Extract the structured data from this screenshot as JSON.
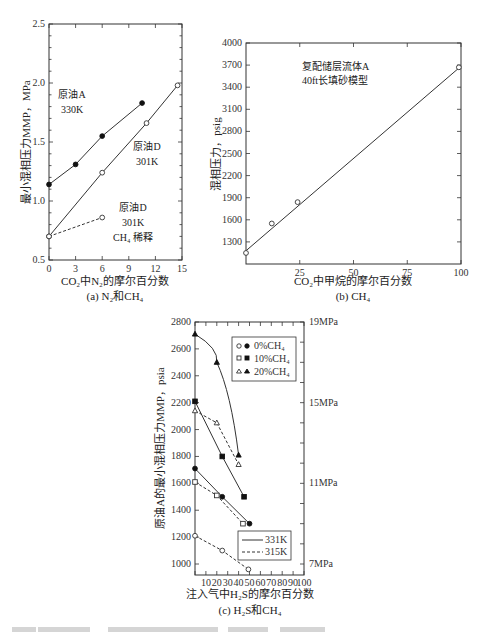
{
  "chart_data": [
    {
      "id": "a",
      "type": "line",
      "caption": "(a) N2和CH4",
      "xlabel": "CO2中N2的摩尔百分数",
      "ylabel": "最小混相压力MMP，MPa",
      "xlim": [
        0,
        15
      ],
      "ylim": [
        0.5,
        2.5
      ],
      "xticks": [
        0,
        3,
        6,
        9,
        12,
        15
      ],
      "yticks": [
        0.5,
        1.0,
        1.5,
        2.0,
        2.5
      ],
      "ytick_labels": [
        "0.5",
        "1.0",
        "1.5",
        "2.0",
        "2.5"
      ],
      "series": [
        {
          "name": "原油A 330K",
          "marker": "filled-circle",
          "line": "solid",
          "x": [
            0,
            3,
            6,
            10.5
          ],
          "y": [
            1.14,
            1.31,
            1.55,
            1.83
          ]
        },
        {
          "name": "原油D 301K",
          "marker": "open-circle",
          "line": "solid",
          "x": [
            0,
            6,
            11,
            14.5
          ],
          "y": [
            0.7,
            1.24,
            1.66,
            1.98
          ]
        },
        {
          "name": "原油D 301K CH4稀释",
          "marker": "open-circle",
          "line": "dashed",
          "x": [
            0,
            6
          ],
          "y": [
            0.7,
            0.86
          ]
        }
      ],
      "annotations": [
        {
          "text": "原油A",
          "x": 2.0,
          "y": 1.6
        },
        {
          "text": "330K",
          "x": 2.0,
          "y": 1.47
        },
        {
          "text": "原油D",
          "x": 10.8,
          "y": 1.48
        },
        {
          "text": "301K",
          "x": 10.8,
          "y": 1.35
        },
        {
          "text": "原油D",
          "x": 9.5,
          "y": 0.99
        },
        {
          "text": "301K",
          "x": 9.5,
          "y": 0.86
        },
        {
          "text": "CH4 稀释",
          "x": 9.5,
          "y": 0.73
        }
      ]
    },
    {
      "id": "b",
      "type": "line",
      "caption": "(b) CH4",
      "xlabel": "CO2中甲烷的摩尔百分数",
      "ylabel": "混相压力，psig",
      "xlim": [
        0,
        100
      ],
      "ylim": [
        1000,
        4000
      ],
      "xticks": [
        25,
        50,
        75,
        100
      ],
      "yticks": [
        1300,
        1600,
        1900,
        2200,
        2500,
        2800,
        3100,
        3400,
        3700,
        4000
      ],
      "series": [
        {
          "name": "复配储层流体A 40ft长填砂模型",
          "marker": "open-circle",
          "line": "solid",
          "x": [
            0,
            12,
            24,
            99
          ],
          "y": [
            1150,
            1550,
            1840,
            3670
          ]
        }
      ],
      "fit_line": {
        "x": [
          0,
          99
        ],
        "y": [
          1180,
          3660
        ]
      },
      "annotations": [
        {
          "text": "复配储层流体A",
          "x": 25,
          "y": 3620
        },
        {
          "text": "40ft长填砂模型",
          "x": 25,
          "y": 3360
        }
      ]
    },
    {
      "id": "c",
      "type": "line",
      "caption": "(c) H2S和CH4",
      "xlabel": "注入气中H2S的摩尔百分数",
      "ylabel": "原油A的最小混相压力MMP，psia",
      "ylabel_right": "MPa",
      "xlim": [
        0,
        100
      ],
      "ylim": [
        920,
        2800
      ],
      "xticks": [
        10,
        20,
        30,
        40,
        50,
        60,
        70,
        80,
        90,
        100
      ],
      "xtick_labels": [
        "10",
        "20",
        "30",
        "40",
        "50",
        "60",
        "70",
        "80",
        "90",
        "100"
      ],
      "yticks": [
        1000,
        1200,
        1400,
        1600,
        1800,
        2000,
        2200,
        2400,
        2600,
        2800
      ],
      "right_ticks": [
        {
          "label": "19MPa",
          "y": 2800
        },
        {
          "label": "15MPa",
          "y": 2200
        },
        {
          "label": "11MPa",
          "y": 1600
        },
        {
          "label": "7MPa",
          "y": 1000
        }
      ],
      "series": [
        {
          "name": "0%CH4 331K",
          "marker": "filled-circle",
          "line": "solid",
          "x": [
            0,
            25,
            50
          ],
          "y": [
            1710,
            1500,
            1300
          ]
        },
        {
          "name": "0%CH4 315K",
          "marker": "open-circle",
          "line": "dashed",
          "x": [
            0,
            25,
            49
          ],
          "y": [
            1210,
            1100,
            960
          ]
        },
        {
          "name": "10%CH4 331K",
          "marker": "filled-square",
          "line": "solid",
          "x": [
            0,
            25,
            45
          ],
          "y": [
            2210,
            1800,
            1500
          ]
        },
        {
          "name": "10%CH4 315K",
          "marker": "open-square",
          "line": "dashed",
          "x": [
            0,
            20,
            44
          ],
          "y": [
            1610,
            1510,
            1300
          ]
        },
        {
          "name": "20%CH4 331K",
          "marker": "filled-triangle",
          "line": "solid-curve",
          "x": [
            0,
            20,
            40
          ],
          "y": [
            2710,
            2500,
            1810
          ]
        },
        {
          "name": "20%CH4 315K",
          "marker": "open-triangle",
          "line": "dashed",
          "x": [
            0,
            20,
            40
          ],
          "y": [
            2140,
            2050,
            1740
          ]
        }
      ],
      "legend_markers": [
        {
          "label": "0%CH4",
          "open": "open-circle",
          "filled": "filled-circle"
        },
        {
          "label": "10%CH4",
          "open": "open-square",
          "filled": "filled-square"
        },
        {
          "label": "20%CH4",
          "open": "open-triangle",
          "filled": "filled-triangle"
        }
      ],
      "legend_lines": [
        {
          "label": "331K",
          "line": "solid"
        },
        {
          "label": "315K",
          "line": "dashed"
        }
      ]
    }
  ],
  "text": {
    "a_y": "最小混相压力MMP，MPa",
    "a_x": "CO₂中N₂的摩尔百分数",
    "a_cap": "(a) N₂和CH₄",
    "b_y": "混相压力，psig",
    "b_x": "CO₂中甲烷的摩尔百分数",
    "b_cap": "(b) CH₄",
    "b_ann1": "复配储层流体A",
    "b_ann2": "40ft长填砂模型",
    "a_ann_A1": "原油A",
    "a_ann_A2": "330K",
    "a_ann_D1": "原油D",
    "a_ann_D2": "301K",
    "a_ann_E1": "原油D",
    "a_ann_E2": "301K",
    "a_ann_E3": "CH₄ 稀释",
    "c_y": "原油A的最小混相压力MMP，psia",
    "c_x": "注入气中H₂S的摩尔百分数",
    "c_cap": "(c) H₂S和CH₄",
    "c_leg1": "0%CH₄",
    "c_leg2": "10%CH₄",
    "c_leg3": "20%CH₄",
    "c_leg4": "331K",
    "c_leg5": "315K"
  }
}
